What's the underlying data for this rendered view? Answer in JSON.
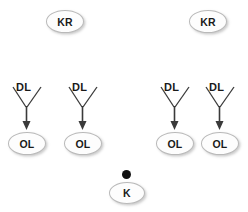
{
  "diagram": {
    "title": "",
    "background_color": "#ffffff",
    "node_fill_color": "#fdfdfd",
    "node_border_color": "#b9b9b9",
    "text_color": "#1a1a1a",
    "edge_color": "#3a3a3a",
    "dot_color": "#111111",
    "top_nodes": [
      {
        "label": "KR",
        "x": 46,
        "y": 10
      },
      {
        "label": "KR",
        "x": 189,
        "y": 10
      }
    ],
    "groups": [
      {
        "source_label": "DL",
        "target_label": "OL",
        "x": 2,
        "y": 76
      },
      {
        "source_label": "DL",
        "target_label": "OL",
        "x": 58,
        "y": 76
      },
      {
        "source_label": "DL",
        "target_label": "OL",
        "x": 150,
        "y": 76
      },
      {
        "source_label": "DL",
        "target_label": "OL",
        "x": 195,
        "y": 76
      }
    ],
    "bottom": {
      "dot_label": "",
      "node_label": "K",
      "dot_x": 122,
      "dot_y": 170,
      "node_x": 109,
      "node_y": 182
    }
  }
}
